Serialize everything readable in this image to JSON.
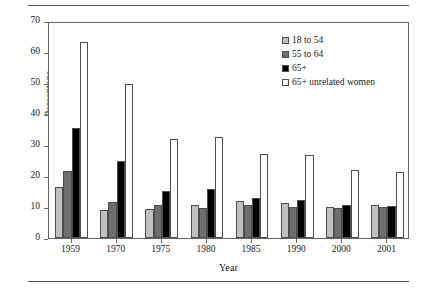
{
  "chart_data": {
    "type": "bar",
    "title": "",
    "xlabel": "Year",
    "ylabel": "Percentage",
    "ylim": [
      0,
      70
    ],
    "yticks": [
      0,
      10,
      20,
      30,
      40,
      50,
      60,
      70
    ],
    "grid": false,
    "legend_position": "top-right",
    "categories": [
      "1959",
      "1970",
      "1975",
      "1980",
      "1985",
      "1990",
      "2000",
      "2001"
    ],
    "series": [
      {
        "name": "18 to 54",
        "color": "#c0c0c0",
        "values": [
          16.5,
          9.0,
          9.4,
          10.8,
          12.0,
          11.2,
          10.0,
          10.6
        ]
      },
      {
        "name": "55 to 64",
        "color": "#6e6e6e",
        "values": [
          21.5,
          11.6,
          10.5,
          9.7,
          10.8,
          10.1,
          9.7,
          9.9
        ]
      },
      {
        "name": "65+",
        "color": "#000000",
        "values": [
          35.4,
          24.7,
          15.3,
          15.8,
          12.9,
          12.4,
          10.5,
          10.3
        ]
      },
      {
        "name": "65+ unrelated women",
        "color": "#ffffff",
        "values": [
          63.3,
          49.7,
          31.9,
          32.5,
          27.2,
          26.9,
          21.9,
          21.4
        ]
      }
    ]
  },
  "axes": {
    "y_title": "Percentage",
    "x_title": "Year",
    "y_tick_labels": [
      "0",
      "10",
      "20",
      "30",
      "40",
      "50",
      "60",
      "70"
    ],
    "x_tick_labels": [
      "1959",
      "1970",
      "1975",
      "1980",
      "1985",
      "1990",
      "2000",
      "2001"
    ]
  },
  "legend": {
    "items": [
      {
        "label": "18 to 54",
        "color": "#c0c0c0"
      },
      {
        "label": "55 to 64",
        "color": "#6e6e6e"
      },
      {
        "label": "65+",
        "color": "#000000"
      },
      {
        "label": "65+ unrelated women",
        "color": "#ffffff"
      }
    ]
  },
  "colors": {
    "axis": "#666666",
    "bar_outline": "#4d4d4d",
    "rule": "#555555",
    "background": "#ffffff",
    "text": "#1a1a1a"
  }
}
